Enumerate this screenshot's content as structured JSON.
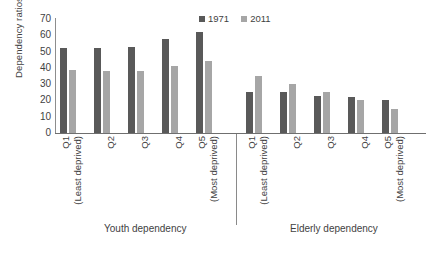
{
  "chart_data": {
    "type": "bar",
    "title": "",
    "xlabel": "",
    "ylabel": "Dependency ratios",
    "ylim": [
      0,
      70
    ],
    "yticks": [
      70,
      60,
      50,
      40,
      30,
      20,
      10,
      0
    ],
    "grid": false,
    "legend_position": "top-center",
    "groups": [
      {
        "name": "Youth dependency",
        "categories": [
          "Q1",
          "Q2",
          "Q3",
          "Q4",
          "Q5"
        ],
        "category_sublabels": [
          "(Least deprived)",
          "",
          "",
          "",
          "(Most deprived)"
        ],
        "series": [
          {
            "name": "1971",
            "values": [
              52,
              52,
              53,
              58,
              62
            ]
          },
          {
            "name": "2011",
            "values": [
              39,
              38,
              38,
              41,
              44
            ]
          }
        ]
      },
      {
        "name": "Elderly dependency",
        "categories": [
          "Q1",
          "Q2",
          "Q3",
          "Q4",
          "Q5"
        ],
        "category_sublabels": [
          "(Least deprived)",
          "",
          "",
          "",
          "(Most deprived)"
        ],
        "series": [
          {
            "name": "1971",
            "values": [
              25,
              25,
              23,
              22,
              20
            ]
          },
          {
            "name": "2011",
            "values": [
              35,
              30,
              25,
              20,
              15
            ]
          }
        ]
      }
    ],
    "series_colors": {
      "1971": "#595959",
      "2011": "#a6a6a6"
    }
  },
  "axis": {
    "y_title": "Dependency ratios",
    "ticks": {
      "t70": "70",
      "t60": "60",
      "t50": "50",
      "t40": "40",
      "t30": "30",
      "t20": "20",
      "t10": "10",
      "t0": "0"
    }
  },
  "legend": {
    "item1": "1971",
    "item2": "2011"
  },
  "labels": {
    "youth": {
      "q1": "Q1",
      "q1_sub": "(Least deprived)",
      "q2": "Q2",
      "q3": "Q3",
      "q4": "Q4",
      "q5": "Q5",
      "q5_sub": "(Most deprived)"
    },
    "elderly": {
      "q1": "Q1",
      "q1_sub": "(Least deprived)",
      "q2": "Q2",
      "q3": "Q3",
      "q4": "Q4",
      "q5": "Q5",
      "q5_sub": "(Most deprived)"
    },
    "group_youth": "Youth dependency",
    "group_elderly": "Elderly dependency"
  }
}
